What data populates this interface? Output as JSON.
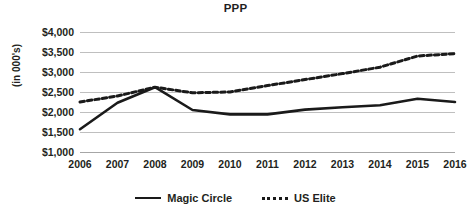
{
  "chart_data": {
    "type": "line",
    "title": "PPP",
    "xlabel": "",
    "ylabel": "(in 000's)",
    "categories": [
      "2006",
      "2007",
      "2008",
      "2009",
      "2010",
      "2011",
      "2012",
      "2013",
      "2014",
      "2015",
      "2016"
    ],
    "series": [
      {
        "name": "Magic Circle",
        "style": "solid",
        "color": "#1a1a1a",
        "values": [
          1570,
          2230,
          2620,
          2050,
          1940,
          1940,
          2060,
          2120,
          2170,
          2330,
          2250
        ]
      },
      {
        "name": "US Elite",
        "style": "dotted",
        "color": "#1a1a1a",
        "values": [
          2250,
          2400,
          2620,
          2480,
          2500,
          2660,
          2810,
          2960,
          3120,
          3400,
          3460
        ]
      }
    ],
    "ylim": [
      1000,
      4000
    ],
    "y_ticks": [
      1000,
      1500,
      2000,
      2500,
      3000,
      3500,
      4000
    ],
    "y_tick_labels": [
      "$1,000",
      "$1,500",
      "$2,000",
      "$2,500",
      "$3,000",
      "$3,500",
      "$4,000"
    ],
    "grid": true,
    "legend_position": "bottom"
  },
  "legend": {
    "items": [
      {
        "label": "Magic Circle",
        "marker": "solid-line-icon"
      },
      {
        "label": "US Elite",
        "marker": "dotted-line-icon"
      }
    ]
  }
}
